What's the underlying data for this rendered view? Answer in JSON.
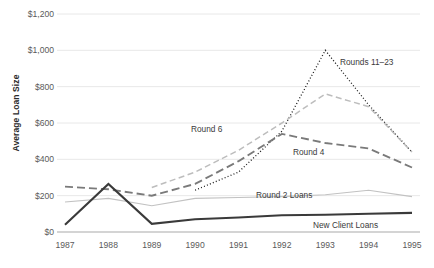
{
  "chart_data": {
    "type": "line",
    "title": "",
    "xlabel": "",
    "ylabel": "Average Loan Size",
    "categories": [
      "1987",
      "1988",
      "1989",
      "1990",
      "1991",
      "1992",
      "1993",
      "1994",
      "1995"
    ],
    "x": [
      1987,
      1988,
      1989,
      1990,
      1991,
      1992,
      1993,
      1994,
      1995
    ],
    "ylim": [
      0,
      1200
    ],
    "ytick_values": [
      0,
      200,
      400,
      600,
      800,
      1000,
      1200
    ],
    "ytick_labels": [
      "$0",
      "$200",
      "$400",
      "$600",
      "$800",
      "$1,000",
      "$1,200"
    ],
    "grid": "horizontal",
    "legend": "inline-annotations",
    "series": [
      {
        "name": "Rounds 11–23",
        "style": "dotted",
        "color": "#1a1a1a",
        "label": "Rounds 11–23",
        "values": [
          null,
          null,
          null,
          230,
          330,
          555,
          1000,
          700,
          440
        ]
      },
      {
        "name": "Round 6",
        "style": "dashed-light",
        "color": "#bdbdbd",
        "label": "Round 6",
        "values": [
          null,
          null,
          245,
          330,
          450,
          600,
          760,
          690,
          440
        ]
      },
      {
        "name": "Round 4",
        "style": "dashed-dark",
        "color": "#7a7a7a",
        "label": "Round 4",
        "values": [
          250,
          235,
          200,
          265,
          390,
          540,
          490,
          460,
          355
        ]
      },
      {
        "name": "Round 2 Loans",
        "style": "solid-thin",
        "color": "#c2c2c2",
        "label": "Round 2 Loans",
        "values": [
          165,
          185,
          145,
          185,
          190,
          195,
          205,
          230,
          195
        ]
      },
      {
        "name": "New Client Loans",
        "style": "solid-thick",
        "color": "#3a3a3a",
        "label": "New Client Loans",
        "values": [
          40,
          265,
          45,
          70,
          80,
          92,
          95,
          100,
          105
        ]
      }
    ],
    "annotations": [
      {
        "text": "Rounds 11–23",
        "x_px": 340,
        "y_px": 57
      },
      {
        "text": "Round 6",
        "x_px": 191,
        "y_px": 124
      },
      {
        "text": "Round 4",
        "x_px": 293,
        "y_px": 147
      },
      {
        "text": "Round 2 Loans",
        "x_px": 256,
        "y_px": 190
      },
      {
        "text": "New Client Loans",
        "x_px": 313,
        "y_px": 220
      }
    ]
  }
}
